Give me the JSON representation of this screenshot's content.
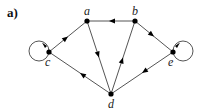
{
  "panel_label": "a)",
  "nodes": [
    {
      "id": "a",
      "label": "a",
      "x": 87,
      "y": 21
    },
    {
      "id": "b",
      "label": "b",
      "x": 135,
      "y": 21
    },
    {
      "id": "c",
      "label": "c",
      "x": 49,
      "y": 52
    },
    {
      "id": "d",
      "label": "d",
      "x": 111,
      "y": 94
    },
    {
      "id": "e",
      "label": "e",
      "x": 173,
      "y": 52
    }
  ],
  "edges": [
    {
      "from": "b",
      "to": "a"
    },
    {
      "from": "a",
      "to": "c"
    },
    {
      "from": "a",
      "to": "d"
    },
    {
      "from": "d",
      "to": "b"
    },
    {
      "from": "b",
      "to": "e"
    },
    {
      "from": "e",
      "to": "d"
    },
    {
      "from": "d",
      "to": "c"
    },
    {
      "from": "c",
      "to": "c",
      "type": "self-loop"
    },
    {
      "from": "e",
      "to": "e",
      "type": "self-loop"
    }
  ],
  "colors": {
    "node": "#000000",
    "edge": "#555555"
  }
}
